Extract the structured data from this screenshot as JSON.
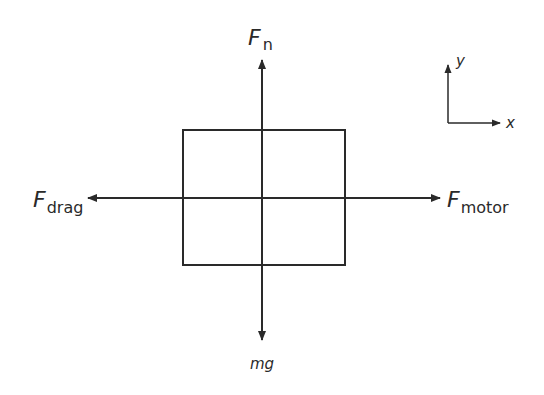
{
  "diagram": {
    "type": "free-body-diagram",
    "colors": {
      "stroke": "#2a2a2a",
      "background": "#ffffff"
    },
    "object": {
      "shape": "rectangle",
      "x": 183,
      "y": 130,
      "width": 162,
      "height": 135
    },
    "forces": [
      {
        "name": "normal",
        "label_main": "F",
        "label_sub": "n",
        "direction": "up"
      },
      {
        "name": "weight",
        "label_main": "mg",
        "label_sub": "",
        "direction": "down"
      },
      {
        "name": "drag",
        "label_main": "F",
        "label_sub": "drag",
        "direction": "left"
      },
      {
        "name": "motor",
        "label_main": "F",
        "label_sub": "motor",
        "direction": "right"
      }
    ],
    "axes": {
      "x_label": "x",
      "y_label": "y"
    }
  }
}
